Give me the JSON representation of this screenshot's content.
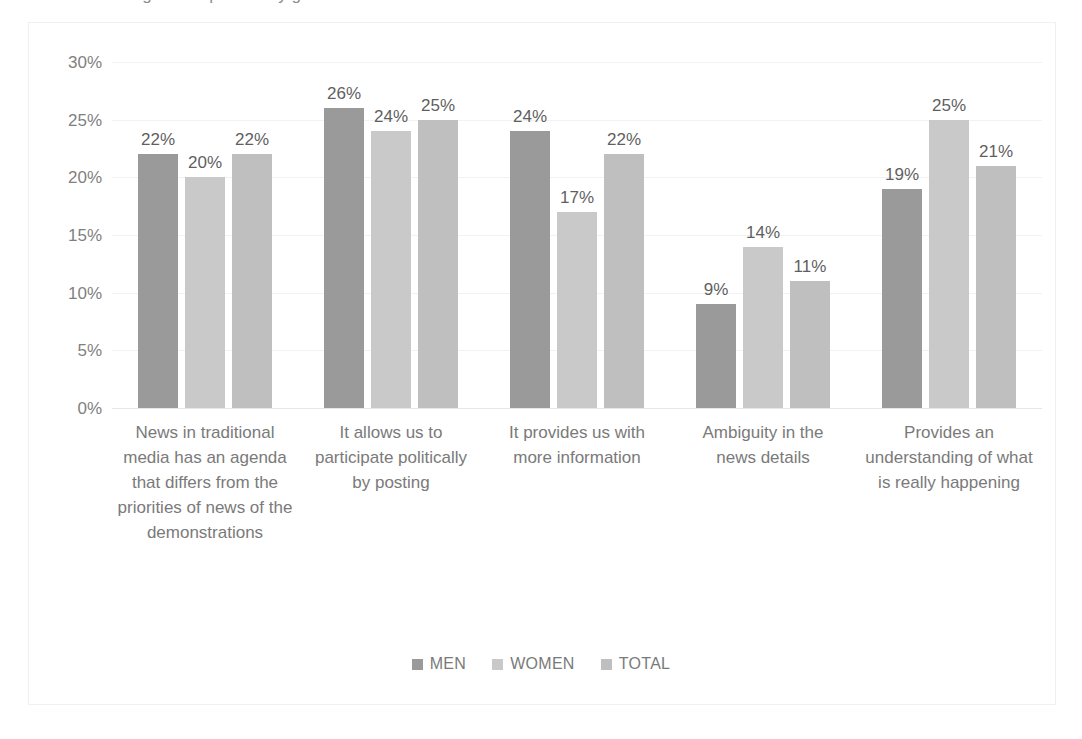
{
  "caption": {
    "text": "Figure: responses by gender"
  },
  "legend": {
    "position": "bottom",
    "items": [
      {
        "label": "MEN",
        "color": "#9a9a9a"
      },
      {
        "label": "WOMEN",
        "color": "#c9c9c9"
      },
      {
        "label": "TOTAL",
        "color": "#bfbfbf"
      }
    ]
  },
  "axis": {
    "yticks": [
      "0%",
      "5%",
      "10%",
      "15%",
      "20%",
      "25%",
      "30%"
    ]
  },
  "chart_data": {
    "type": "bar",
    "title": "",
    "xlabel": "",
    "ylabel": "",
    "ylim": [
      0,
      30
    ],
    "ytick_values": [
      0,
      5,
      10,
      15,
      20,
      25,
      30
    ],
    "grid": true,
    "legend_position": "bottom",
    "value_suffix": "%",
    "categories": [
      "News in traditional media has an agenda that differs from the priorities of news of the demonstrations",
      "It allows us to participate politically by posting",
      "It provides us with more information",
      "Ambiguity in the news details",
      "Provides an understanding of what is really happening"
    ],
    "series": [
      {
        "name": "MEN",
        "color": "#9a9a9a",
        "values": [
          22,
          26,
          24,
          9,
          19
        ],
        "labels": [
          "22%",
          "26%",
          "24%",
          "9%",
          "19%"
        ]
      },
      {
        "name": "WOMEN",
        "color": "#c9c9c9",
        "values": [
          20,
          24,
          17,
          14,
          25
        ],
        "labels": [
          "20%",
          "24%",
          "17%",
          "14%",
          "25%"
        ]
      },
      {
        "name": "TOTAL",
        "color": "#bfbfbf",
        "values": [
          22,
          25,
          22,
          11,
          21
        ],
        "labels": [
          "22%",
          "25%",
          "22%",
          "11%",
          "21%"
        ]
      }
    ]
  }
}
